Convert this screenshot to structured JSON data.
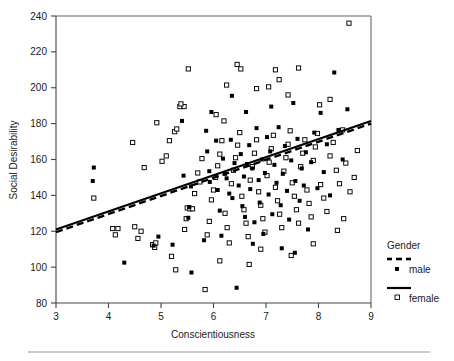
{
  "chart_data": {
    "type": "scatter",
    "title": "",
    "xlabel": "Conscientiousness",
    "ylabel": "Social Desirability",
    "xlim": [
      3,
      9
    ],
    "ylim": [
      80,
      240
    ],
    "xticks": [
      3,
      4,
      5,
      6,
      7,
      8,
      9
    ],
    "yticks": [
      80,
      100,
      120,
      140,
      160,
      180,
      200,
      220,
      240
    ],
    "xtick_labels": [
      "3",
      "4",
      "5",
      "6",
      "7",
      "8",
      "9"
    ],
    "ytick_labels": [
      "80",
      "100",
      "120",
      "140",
      "160",
      "180",
      "200",
      "220",
      "240"
    ],
    "grid": false,
    "legend_position": "right",
    "legend_title": "Gender",
    "series": [
      {
        "name": "male",
        "marker": "filled-square",
        "marker_color": "#000000",
        "line_style": "dashed",
        "fit_line": {
          "x": [
            3,
            9
          ],
          "y": [
            119.5,
            180.0
          ]
        },
        "points": [
          [
            3.72,
            155.5
          ],
          [
            3.7,
            148.0
          ],
          [
            4.3,
            102.5
          ],
          [
            4.95,
            117.0
          ],
          [
            4.86,
            112.0
          ],
          [
            5.22,
            112.5
          ],
          [
            5.4,
            181.5
          ],
          [
            5.43,
            151.0
          ],
          [
            5.54,
            133.5
          ],
          [
            5.52,
            127.5
          ],
          [
            5.57,
            145.0
          ],
          [
            5.58,
            97.0
          ],
          [
            5.82,
            115.0
          ],
          [
            5.86,
            176.0
          ],
          [
            5.92,
            153.5
          ],
          [
            5.93,
            147.5
          ],
          [
            5.96,
            186.5
          ],
          [
            6.05,
            170.5
          ],
          [
            6.08,
            143.0
          ],
          [
            6.12,
            131.5
          ],
          [
            6.18,
            160.5
          ],
          [
            6.22,
            152.0
          ],
          [
            6.25,
            149.5
          ],
          [
            6.3,
            141.0
          ],
          [
            6.33,
            171.0
          ],
          [
            6.36,
            138.5
          ],
          [
            6.4,
            158.0
          ],
          [
            6.44,
            88.5
          ],
          [
            6.48,
            145.5
          ],
          [
            6.52,
            163.0
          ],
          [
            6.55,
            134.0
          ],
          [
            6.58,
            150.5
          ],
          [
            6.6,
            128.0
          ],
          [
            6.64,
            157.5
          ],
          [
            6.68,
            168.0
          ],
          [
            6.7,
            143.5
          ],
          [
            6.74,
            155.0
          ],
          [
            6.78,
            125.0
          ],
          [
            6.82,
            177.5
          ],
          [
            6.86,
            148.5
          ],
          [
            6.88,
            136.0
          ],
          [
            6.92,
            160.0
          ],
          [
            6.95,
            118.5
          ],
          [
            6.98,
            152.5
          ],
          [
            7.02,
            172.5
          ],
          [
            7.05,
            140.5
          ],
          [
            7.08,
            164.5
          ],
          [
            7.12,
            129.5
          ],
          [
            7.16,
            157.0
          ],
          [
            7.2,
            147.0
          ],
          [
            7.24,
            178.0
          ],
          [
            7.28,
            134.5
          ],
          [
            7.32,
            152.0
          ],
          [
            7.36,
            167.5
          ],
          [
            7.4,
            142.5
          ],
          [
            7.44,
            126.5
          ],
          [
            7.48,
            159.5
          ],
          [
            7.52,
            191.5
          ],
          [
            7.56,
            148.0
          ],
          [
            7.6,
            171.5
          ],
          [
            7.64,
            137.0
          ],
          [
            7.68,
            155.0
          ],
          [
            7.72,
            145.5
          ],
          [
            7.76,
            164.0
          ],
          [
            7.8,
            121.0
          ],
          [
            7.86,
            158.5
          ],
          [
            7.92,
            175.0
          ],
          [
            7.98,
            144.0
          ],
          [
            8.04,
            186.0
          ],
          [
            8.1,
            153.0
          ],
          [
            8.16,
            168.5
          ],
          [
            8.22,
            140.0
          ],
          [
            8.3,
            208.5
          ],
          [
            8.38,
            176.5
          ],
          [
            8.46,
            160.0
          ],
          [
            8.55,
            188.0
          ],
          [
            6.35,
            195.5
          ],
          [
            7.1,
            189.5
          ],
          [
            6.62,
            186.5
          ],
          [
            5.88,
            164.5
          ],
          [
            6.15,
            117.5
          ],
          [
            6.75,
            113.0
          ],
          [
            7.3,
            110.5
          ],
          [
            7.55,
            108.0
          ]
        ]
      },
      {
        "name": "female",
        "marker": "open-square",
        "marker_color": "#ffffff",
        "marker_edge_color": "#000000",
        "line_style": "solid",
        "fit_line": {
          "x": [
            3,
            9
          ],
          "y": [
            121.0,
            181.5
          ]
        },
        "points": [
          [
            3.72,
            138.5
          ],
          [
            4.08,
            121.5
          ],
          [
            4.18,
            121.5
          ],
          [
            4.13,
            118.0
          ],
          [
            4.5,
            122.5
          ],
          [
            4.56,
            116.0
          ],
          [
            4.62,
            120.0
          ],
          [
            4.84,
            112.5
          ],
          [
            4.88,
            111.0
          ],
          [
            4.9,
            113.5
          ],
          [
            4.46,
            169.5
          ],
          [
            4.68,
            155.5
          ],
          [
            5.02,
            159.0
          ],
          [
            5.1,
            162.0
          ],
          [
            5.16,
            170.5
          ],
          [
            5.26,
            175.5
          ],
          [
            5.3,
            177.0
          ],
          [
            5.36,
            189.5
          ],
          [
            5.44,
            189.5
          ],
          [
            5.2,
            106.0
          ],
          [
            5.28,
            98.5
          ],
          [
            5.45,
            121.0
          ],
          [
            5.48,
            127.0
          ],
          [
            5.5,
            133.0
          ],
          [
            5.55,
            132.5
          ],
          [
            5.6,
            132.5
          ],
          [
            5.64,
            141.0
          ],
          [
            5.7,
            152.5
          ],
          [
            5.74,
            147.5
          ],
          [
            5.78,
            160.5
          ],
          [
            5.84,
            87.5
          ],
          [
            5.88,
            118.0
          ],
          [
            5.92,
            125.5
          ],
          [
            5.96,
            137.5
          ],
          [
            6.0,
            143.0
          ],
          [
            6.04,
            150.0
          ],
          [
            6.08,
            156.5
          ],
          [
            6.12,
            163.0
          ],
          [
            6.16,
            170.5
          ],
          [
            6.2,
            181.5
          ],
          [
            6.22,
            130.0
          ],
          [
            6.26,
            122.0
          ],
          [
            6.3,
            113.5
          ],
          [
            6.34,
            146.5
          ],
          [
            6.38,
            154.0
          ],
          [
            6.42,
            161.0
          ],
          [
            6.46,
            168.0
          ],
          [
            6.5,
            175.0
          ],
          [
            6.54,
            139.5
          ],
          [
            6.58,
            132.0
          ],
          [
            6.62,
            124.5
          ],
          [
            6.66,
            117.0
          ],
          [
            6.7,
            148.5
          ],
          [
            6.74,
            156.0
          ],
          [
            6.78,
            163.5
          ],
          [
            6.82,
            171.0
          ],
          [
            6.86,
            142.0
          ],
          [
            6.9,
            134.5
          ],
          [
            6.94,
            127.0
          ],
          [
            6.98,
            119.5
          ],
          [
            7.02,
            151.0
          ],
          [
            7.06,
            158.5
          ],
          [
            7.1,
            166.0
          ],
          [
            7.14,
            173.5
          ],
          [
            7.18,
            144.5
          ],
          [
            7.22,
            137.0
          ],
          [
            7.26,
            129.5
          ],
          [
            7.3,
            122.0
          ],
          [
            7.34,
            153.5
          ],
          [
            7.38,
            161.0
          ],
          [
            7.42,
            168.5
          ],
          [
            7.46,
            176.0
          ],
          [
            7.5,
            147.0
          ],
          [
            7.54,
            139.5
          ],
          [
            7.58,
            132.0
          ],
          [
            7.62,
            124.5
          ],
          [
            7.66,
            156.0
          ],
          [
            7.7,
            163.5
          ],
          [
            7.74,
            171.0
          ],
          [
            7.78,
            143.0
          ],
          [
            7.82,
            135.5
          ],
          [
            7.86,
            128.0
          ],
          [
            7.9,
            159.5
          ],
          [
            7.94,
            167.0
          ],
          [
            7.98,
            174.5
          ],
          [
            8.04,
            146.0
          ],
          [
            8.1,
            138.5
          ],
          [
            8.16,
            131.0
          ],
          [
            8.22,
            162.0
          ],
          [
            8.28,
            169.5
          ],
          [
            8.34,
            154.0
          ],
          [
            8.4,
            146.5
          ],
          [
            8.46,
            176.5
          ],
          [
            8.52,
            158.0
          ],
          [
            8.58,
            236.0
          ],
          [
            8.68,
            150.0
          ],
          [
            8.74,
            165.0
          ],
          [
            5.52,
            210.5
          ],
          [
            6.25,
            201.5
          ],
          [
            6.45,
            213.0
          ],
          [
            6.52,
            210.5
          ],
          [
            6.82,
            199.5
          ],
          [
            7.05,
            200.5
          ],
          [
            7.18,
            210.0
          ],
          [
            7.25,
            204.5
          ],
          [
            7.42,
            196.0
          ],
          [
            7.62,
            211.0
          ],
          [
            8.02,
            190.5
          ],
          [
            8.22,
            193.5
          ],
          [
            6.05,
            185.0
          ],
          [
            5.38,
            191.0
          ],
          [
            4.92,
            180.5
          ],
          [
            6.9,
            110.0
          ],
          [
            7.48,
            106.5
          ],
          [
            6.12,
            103.5
          ],
          [
            7.9,
            113.0
          ],
          [
            8.36,
            120.5
          ],
          [
            8.48,
            127.0
          ],
          [
            8.6,
            142.0
          ],
          [
            6.68,
            101.5
          ]
        ]
      }
    ]
  },
  "legend": {
    "title": "Gender",
    "entries": [
      {
        "label": "male",
        "marker": "filled-square",
        "line": "dashed"
      },
      {
        "label": "female",
        "marker": "open-square",
        "line": "solid"
      }
    ]
  },
  "colors": {
    "ink": "#000000",
    "frame": "#555555",
    "rule": "#888888"
  }
}
